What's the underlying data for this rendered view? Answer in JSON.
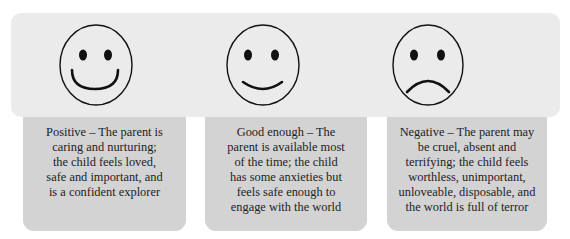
{
  "faces": [
    {
      "id": "positive",
      "icon": "happy-face-icon"
    },
    {
      "id": "good-enough",
      "icon": "slight-smile-face-icon"
    },
    {
      "id": "negative",
      "icon": "sad-face-icon"
    }
  ],
  "captions": [
    {
      "id": "positive",
      "lines": [
        "Positive – The parent is",
        "caring and nurturing;",
        "the child feels loved,",
        "safe and important, and",
        "is a confident explorer"
      ]
    },
    {
      "id": "good-enough",
      "lines": [
        "Good enough – The",
        "parent is available most",
        "of the time; the child",
        "has some anxieties but",
        "feels safe enough to",
        "engage with the world"
      ]
    },
    {
      "id": "negative",
      "lines": [
        "Negative – The parent may",
        "be cruel, absent and",
        "terrifying; the child feels",
        "worthless, unimportant,",
        "unloveable, disposable, and",
        "the world is full of terror"
      ]
    }
  ],
  "colors": {
    "band_background": "#ebebeb",
    "caption_background": "#d3d3d3",
    "text": "#222222",
    "face_stroke": "#111111"
  }
}
